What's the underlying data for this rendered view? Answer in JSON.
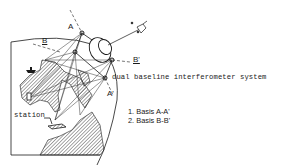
{
  "figure": {
    "title_label": "dual baseline interferometer system",
    "station_label": "station",
    "points": {
      "A": "A",
      "A_prime": "A'",
      "B": "B",
      "B_prime": "B'"
    },
    "legend": [
      {
        "index": "1.",
        "text": "Basis A-A'"
      },
      {
        "index": "2.",
        "text": "Basis B-B'"
      }
    ],
    "colors": {
      "ink": "#1a1a1a",
      "background": "#ffffff"
    }
  }
}
